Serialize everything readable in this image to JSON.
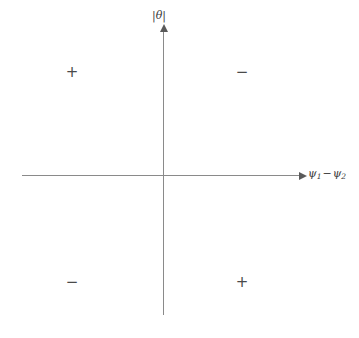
{
  "chart_data": {
    "type": "scatter",
    "title": "",
    "subtitle": "",
    "xlabel": "ψ₁ − ψ₂",
    "ylabel": "|θ|",
    "grid": false,
    "legend": null,
    "axes": {
      "origin_x": 163,
      "origin_y": 175,
      "x_axis_start": 22,
      "x_axis_end": 301,
      "y_axis_top": 30,
      "y_axis_bottom": 315,
      "x_arrow_direction": "right",
      "y_arrow_direction": "up"
    },
    "annotations": [
      {
        "id": "top-left",
        "text": "+",
        "quadrant": "upper-left",
        "x": 72,
        "y": 73
      },
      {
        "id": "top-right",
        "text": "−",
        "quadrant": "upper-right",
        "x": 242,
        "y": 73
      },
      {
        "id": "bottom-left",
        "text": "−",
        "quadrant": "lower-left",
        "x": 72,
        "y": 283
      },
      {
        "id": "bottom-right",
        "text": "+",
        "quadrant": "lower-right",
        "x": 242,
        "y": 283
      }
    ],
    "series": [],
    "values": [],
    "categories": []
  },
  "figure": {
    "background_color": "#ffffff",
    "axis_color": "#8a8a8a",
    "arrow_color": "#5a5a5a",
    "text_color": "#3c3c3c",
    "sign_color": "#4a4a4a",
    "y_axis_label": "|θ|",
    "x_axis_label_psi1": "ψ",
    "x_axis_label_sub1": "1",
    "x_axis_label_operator": "−",
    "x_axis_label_psi2": "ψ",
    "x_axis_label_sub2": "2",
    "signs": {
      "top_left": "+",
      "top_right": "−",
      "bottom_left": "−",
      "bottom_right": "+"
    }
  }
}
